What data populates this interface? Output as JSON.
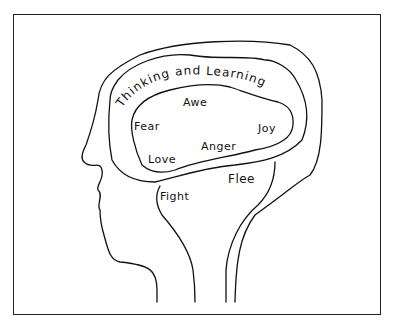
{
  "diagram": {
    "type": "hand-drawn head profile with nested brain regions",
    "regions": [
      {
        "name": "outer",
        "label": "Thinking and Learning"
      },
      {
        "name": "middle",
        "labels": [
          "Awe",
          "Fear",
          "Joy",
          "Anger",
          "Love"
        ]
      },
      {
        "name": "inner",
        "labels": [
          "Flee",
          "Fight"
        ]
      }
    ],
    "labels": {
      "thinking_and_learning": "Thinking and Learning",
      "awe": "Awe",
      "fear": "Fear",
      "joy": "Joy",
      "anger": "Anger",
      "love": "Love",
      "flee": "Flee",
      "fight": "Fight"
    },
    "colors": {
      "line": "#111111",
      "background": "#ffffff"
    }
  }
}
